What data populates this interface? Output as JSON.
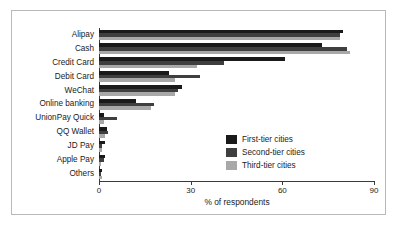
{
  "chart_data": {
    "type": "bar",
    "orientation": "horizontal",
    "title": "",
    "subtitle": "",
    "xlabel": "% of respondents",
    "ylabel": "",
    "xlim": [
      0,
      90
    ],
    "xticks": [
      0,
      30,
      60,
      90
    ],
    "xtick_labels": [
      "0",
      "30",
      "60",
      "90"
    ],
    "grid": false,
    "legend_position": "center-right-inside",
    "categories": [
      "Alipay",
      "Cash",
      "Credit Card",
      "Debit Card",
      "WeChat",
      "Online banking",
      "UnionPay Quick",
      "QQ Wallet",
      "JD Pay",
      "Apple Pay",
      "Others"
    ],
    "series": [
      {
        "name": "First-tier cities",
        "color": "#1a1a1a",
        "values": [
          80,
          73,
          61,
          23,
          27,
          12,
          1.5,
          2.5,
          2,
          2,
          1
        ]
      },
      {
        "name": "Second-tier cities",
        "color": "#3f3f3f",
        "values": [
          79,
          81,
          41,
          33,
          26,
          18,
          6,
          3,
          1,
          1.5,
          0.8
        ]
      },
      {
        "name": "Third-tier cities",
        "color": "#a8a8a8",
        "values": [
          79,
          82,
          32,
          25,
          25,
          17,
          1.5,
          2,
          1,
          0.8,
          1
        ]
      }
    ]
  }
}
